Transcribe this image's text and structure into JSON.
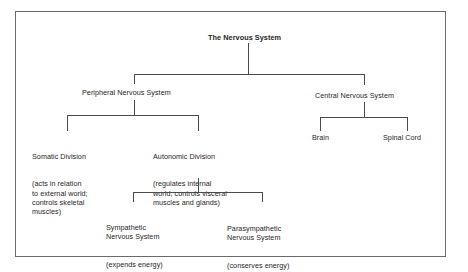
{
  "diagram": {
    "type": "hierarchy-tree",
    "root": {
      "label": "The Nervous System"
    },
    "level1": {
      "peripheral": {
        "label": "Peripheral Nervous System"
      },
      "central": {
        "label": "Central Nervous System"
      }
    },
    "level2": {
      "somatic": {
        "label": "Somatic Division",
        "description": "(acts in relation\nto external world;\ncontrols skeletal\nmuscles)"
      },
      "autonomic": {
        "label": "Autonomic Division",
        "description": "(regulates internal\nworld; controls visceral\nmuscles and glands)"
      },
      "brain": {
        "label": "Brain"
      },
      "spinal_cord": {
        "label": "Spinal Cord"
      }
    },
    "level3": {
      "sympathetic": {
        "label": "Sympathetic\nNervous System",
        "description": "(expends energy)"
      },
      "parasympathetic": {
        "label": "Parasympathetic\nNervous System",
        "description": "(conserves energy)"
      }
    },
    "edges": [
      [
        "The Nervous System",
        "Peripheral Nervous System"
      ],
      [
        "The Nervous System",
        "Central Nervous System"
      ],
      [
        "Peripheral Nervous System",
        "Somatic Division"
      ],
      [
        "Peripheral Nervous System",
        "Autonomic Division"
      ],
      [
        "Central Nervous System",
        "Brain"
      ],
      [
        "Central Nervous System",
        "Spinal Cord"
      ],
      [
        "Autonomic Division",
        "Sympathetic Nervous System"
      ],
      [
        "Autonomic Division",
        "Parasympathetic Nervous System"
      ]
    ]
  }
}
